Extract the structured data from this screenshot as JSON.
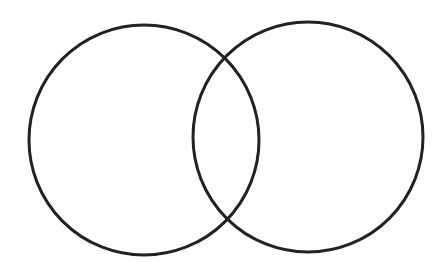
{
  "diagram": {
    "type": "venn",
    "background": "#ffffff",
    "stroke_color": "#222222",
    "stroke_width": 3,
    "circles": [
      {
        "name": "left-circle",
        "cx": 144,
        "cy": 140,
        "r": 115,
        "fill": "none"
      },
      {
        "name": "right-circle",
        "cx": 308,
        "cy": 137,
        "r": 115,
        "fill": "none"
      }
    ],
    "labels": []
  }
}
